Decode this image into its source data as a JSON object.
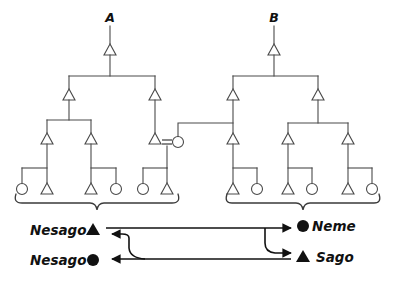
{
  "figure": {
    "type": "kinship-genealogy-diagram",
    "background_color": "#ffffff",
    "line_color": "#4a4a4a",
    "glyph_color": "#111111",
    "tree_labels": [
      {
        "id": "A",
        "text": "A"
      },
      {
        "id": "B",
        "text": "B"
      }
    ],
    "symbol_legend": {
      "triangle_open": "male",
      "circle_open": "female",
      "triangle_filled": "filled-triangle-marker",
      "circle_filled": "filled-circle-marker",
      "equals": "marriage-link"
    },
    "name_exchange": {
      "left_rows": [
        {
          "text": "Nesago",
          "marker": "▲",
          "marker_type": "filled-triangle"
        },
        {
          "text": "Nesago",
          "marker": "●",
          "marker_type": "filled-circle"
        }
      ],
      "right_rows": [
        {
          "marker": "●",
          "marker_type": "filled-circle",
          "text": "Neme"
        },
        {
          "marker": "▲",
          "marker_type": "filled-triangle",
          "text": "Sago"
        }
      ]
    },
    "trees": {
      "A": {
        "label": "A",
        "apex_symbol": "triangle",
        "generations": 4,
        "leaf_sequence": [
          "circle",
          "triangle",
          "triangle",
          "circle",
          "circle",
          "triangle"
        ]
      },
      "B": {
        "label": "B",
        "apex_symbol": "triangle",
        "generations": 4,
        "leaf_sequence": [
          "triangle",
          "circle",
          "triangle",
          "circle",
          "triangle",
          "circle"
        ]
      }
    },
    "marriage": {
      "symbol": "=",
      "left_partner": "triangle",
      "right_partner": "circle"
    }
  }
}
